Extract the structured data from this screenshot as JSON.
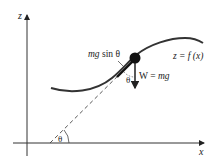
{
  "diagram": {
    "axes": {
      "vertical_label": "z",
      "horizontal_label": "x"
    },
    "curve_label": "z = f (x)",
    "force_label": "W = mg",
    "component_label": "mg sin θ",
    "angle_label_bottom": "θ",
    "angle_label_ball": "θ",
    "colors": {
      "ink": "#222222",
      "curve": "#333333",
      "background": "#ffffff"
    }
  }
}
